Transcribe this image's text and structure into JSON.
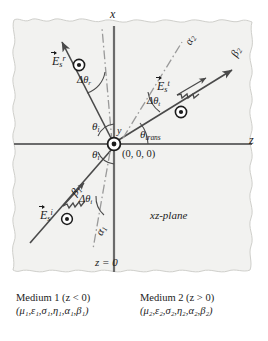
{
  "figure": {
    "type": "physics-diagram",
    "plane_label": "xz-plane",
    "interface_label": "z = 0",
    "origin_label": "(0, 0, 0)",
    "background_color": "#f2f2f0",
    "line_color": "#4a4a4a",
    "text_color": "#1c1c1c"
  },
  "axes": {
    "x_label": "x",
    "y_label": "y",
    "z_label": "z"
  },
  "angles": {
    "theta_i_upper": {
      "symbol": "θ",
      "sub": "i"
    },
    "theta_i_lower": {
      "symbol": "θ",
      "sub": "i"
    },
    "theta_trans": {
      "symbol": "θ",
      "sub": "trans"
    },
    "delta_theta_r": {
      "symbol": "Δθ",
      "sub": "r"
    },
    "delta_theta_t": {
      "symbol": "Δθ",
      "sub": "t"
    },
    "delta_theta_i": {
      "symbol": "Δθ",
      "sub": "i"
    }
  },
  "fields": {
    "incident": {
      "symbol": "E",
      "sub": "s",
      "sup": "i",
      "name": "incident-electric-field"
    },
    "reflected": {
      "symbol": "E",
      "sub": "s",
      "sup": "r",
      "name": "reflected-electric-field"
    },
    "transmitted": {
      "symbol": "E",
      "sub": "s",
      "sup": "t",
      "name": "transmitted-electric-field"
    }
  },
  "vectors": {
    "alpha_1": {
      "symbol": "α",
      "sub": "1"
    },
    "beta_1": {
      "symbol": "β",
      "sub": "1"
    },
    "alpha_2": {
      "symbol": "α",
      "sub": "2"
    },
    "beta_2": {
      "symbol": "β",
      "sub": "2"
    }
  },
  "media": [
    {
      "title": "Medium 1 (z < 0)",
      "params": "(μ₁,ε₁,σ₁,η₁,α₁,β₁)",
      "name": "medium-1"
    },
    {
      "title": "Medium 2 (z > 0)",
      "params": "(μ₂,ε₂,σ₂,η₂,α₂,β₂)",
      "name": "medium-2"
    }
  ]
}
